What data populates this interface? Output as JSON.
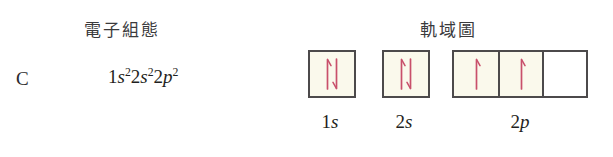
{
  "headings": {
    "electron_configuration": "電子組態",
    "orbital_diagram": "軌域圖"
  },
  "element": {
    "symbol": "C"
  },
  "electron_configuration": {
    "full_text": "1s²2s²2p²",
    "terms": [
      {
        "shell": "1",
        "orbital": "s",
        "electrons": "2"
      },
      {
        "shell": "2",
        "orbital": "s",
        "electrons": "2"
      },
      {
        "shell": "2",
        "orbital": "p",
        "electrons": "2"
      }
    ]
  },
  "orbital_diagram": {
    "arrow_color": "#c8506b",
    "box_border_color": "#4c4a4b",
    "filled_box_color": "#faf9ec",
    "empty_box_color": "#ffffff",
    "groups": [
      {
        "id": "1s",
        "label_shell": "1",
        "label_orbital": "s",
        "boxes": [
          {
            "occupancy": "paired",
            "arrows": [
              "up",
              "down"
            ],
            "shaded": true
          }
        ]
      },
      {
        "id": "2s",
        "label_shell": "2",
        "label_orbital": "s",
        "boxes": [
          {
            "occupancy": "paired",
            "arrows": [
              "up",
              "down"
            ],
            "shaded": true
          }
        ]
      },
      {
        "id": "2p",
        "label_shell": "2",
        "label_orbital": "p",
        "boxes": [
          {
            "occupancy": "single",
            "arrows": [
              "up"
            ],
            "shaded": true
          },
          {
            "occupancy": "single",
            "arrows": [
              "up"
            ],
            "shaded": true
          },
          {
            "occupancy": "empty",
            "arrows": [],
            "shaded": false
          }
        ]
      }
    ]
  }
}
